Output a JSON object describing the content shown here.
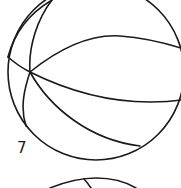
{
  "figure": {
    "label": "7",
    "stroke_color": "#1a1a1a",
    "background": "#ffffff"
  }
}
